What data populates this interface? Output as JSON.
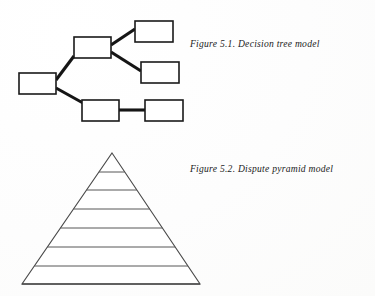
{
  "page": {
    "background_color": "#fefefe",
    "ink_color": "#1a1a1a",
    "width": 375,
    "height": 296
  },
  "figures": [
    {
      "id": "decision-tree",
      "caption": "Figure 5.1. Decision tree model",
      "type": "node-link-diagram",
      "boxes": [
        {
          "name": "root-node",
          "x": 19,
          "y": 73,
          "w": 37,
          "h": 21,
          "label": ""
        },
        {
          "name": "branch-node",
          "x": 74,
          "y": 37,
          "w": 37,
          "h": 21,
          "label": ""
        },
        {
          "name": "leaf-node-top",
          "x": 135,
          "y": 21,
          "w": 38,
          "h": 21,
          "label": ""
        },
        {
          "name": "leaf-node-middle",
          "x": 141,
          "y": 62,
          "w": 38,
          "h": 21,
          "label": ""
        },
        {
          "name": "leaf-node-bottom-left",
          "x": 82,
          "y": 100,
          "w": 37,
          "h": 21,
          "label": ""
        },
        {
          "name": "leaf-node-bottom-right",
          "x": 145,
          "y": 100,
          "w": 38,
          "h": 21,
          "label": ""
        }
      ],
      "links": [
        {
          "name": "link-root-to-branch",
          "x1": 56,
          "y1": 80,
          "x2": 74,
          "y2": 56
        },
        {
          "name": "link-root-to-bottom-left",
          "x1": 56,
          "y1": 88,
          "x2": 83,
          "y2": 103
        },
        {
          "name": "link-branch-to-leaf-top",
          "x1": 111,
          "y1": 45,
          "x2": 135,
          "y2": 29
        },
        {
          "name": "link-branch-to-leaf-middle",
          "x1": 111,
          "y1": 52,
          "x2": 141,
          "y2": 71
        },
        {
          "name": "link-bottom-left-to-right",
          "x1": 119,
          "y1": 110,
          "x2": 145,
          "y2": 110
        }
      ]
    },
    {
      "id": "dispute-pyramid",
      "caption": "Figure 5.2. Dispute pyramid model",
      "type": "layered-triangle",
      "apex": {
        "x": 112,
        "y": 153
      },
      "base_left": {
        "x": 22,
        "y": 284
      },
      "base_right": {
        "x": 200,
        "y": 284
      },
      "divider_levels": [
        172,
        190,
        209,
        228,
        247,
        266
      ],
      "layer_count": 7
    }
  ]
}
